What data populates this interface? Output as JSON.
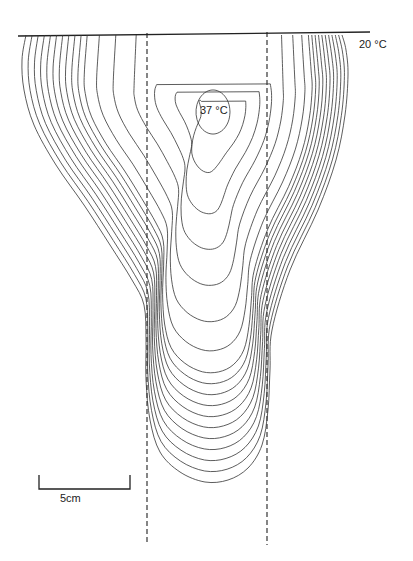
{
  "figure": {
    "type": "isotherm-contour-diagram",
    "labels": {
      "core_temperature": "37 °C",
      "boundary_temperature": "20 °C",
      "scale_bar": "5cm"
    },
    "colors": {
      "line": "#333333",
      "background": "#ffffff"
    }
  },
  "chart_data": {
    "type": "contour",
    "title": "",
    "annotations": [
      "37 °C",
      "20 °C",
      "5cm"
    ],
    "contour_range_celsius": [
      20,
      37
    ],
    "scale_bar_cm": 5,
    "reference_lines": "two vertical dashed lines",
    "surface_line": "horizontal solid line at top"
  }
}
